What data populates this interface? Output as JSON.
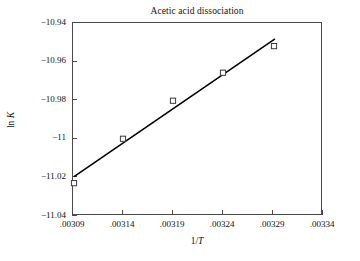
{
  "chart_data": {
    "type": "scatter",
    "title": "Acetic acid dissociation",
    "xlabel": "1/T",
    "ylabel": "ln K",
    "xlabel_plain": "1/T",
    "ylabel_plain": "ln K",
    "xlim": [
      0.00309,
      0.00334
    ],
    "ylim": [
      -11.04,
      -10.94
    ],
    "grid": false,
    "legend": "none",
    "x_tick_labels": [
      ".00309",
      ".00314",
      ".00319",
      ".00324",
      ".00329",
      ".00334"
    ],
    "x_tick_values": [
      0.00309,
      0.00314,
      0.00319,
      0.00324,
      0.00329,
      0.00334
    ],
    "y_tick_labels": [
      "−10.94",
      "−10.96",
      "−10.98",
      "−11",
      "−11.02",
      "−11.04"
    ],
    "y_tick_values": [
      -10.94,
      -10.96,
      -10.98,
      -11.0,
      -11.02,
      -11.04
    ],
    "marker": "open-square",
    "points": [
      {
        "x": 0.003092,
        "y": -11.0235
      },
      {
        "x": 0.003141,
        "y": -11.0005
      },
      {
        "x": 0.003191,
        "y": -10.9808
      },
      {
        "x": 0.003241,
        "y": -10.9663
      },
      {
        "x": 0.003292,
        "y": -10.9525
      }
    ],
    "x": [
      0.003092,
      0.003141,
      0.003191,
      0.003241,
      0.003292
    ],
    "values": [
      -11.0235,
      -11.0005,
      -10.9808,
      -10.9663,
      -10.9525
    ],
    "fit_line": {
      "type": "linear-trendline",
      "x_start": 0.003092,
      "y_start": -11.0201,
      "x_end": 0.003293,
      "y_end": -10.9487
    }
  },
  "colors": {
    "axis": "#4a4a4a",
    "line": "#000000",
    "marker_stroke": "#3a3a3a",
    "text": "#111111",
    "background": "#ffffff"
  }
}
